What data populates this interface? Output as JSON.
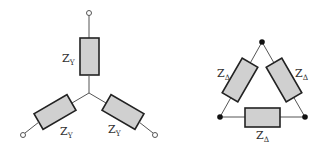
{
  "diagram": {
    "title": "",
    "wye": {
      "label_main": "Z",
      "label_sub": "Y",
      "branches": [
        "top",
        "bottom-left",
        "bottom-right"
      ]
    },
    "delta": {
      "label_main": "Z",
      "label_sub": "Δ",
      "branches": [
        "left",
        "right",
        "bottom"
      ]
    },
    "colors": {
      "resistor_fill": "#d0d0d0",
      "resistor_stroke": "#222222",
      "wire": "#555555",
      "node": "#111111"
    }
  }
}
